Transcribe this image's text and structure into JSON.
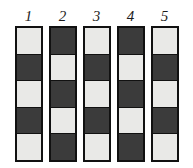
{
  "figure": {
    "title": "",
    "background_color": "#ffffff",
    "border_color": "#111111",
    "light_color": "#e9e9e7",
    "dark_color": "#3b3b3b",
    "rows": 5,
    "columns_count": 5,
    "columns": [
      {
        "label": "1",
        "cells": [
          "light",
          "dark",
          "light",
          "dark",
          "light"
        ]
      },
      {
        "label": "2",
        "cells": [
          "dark",
          "light",
          "dark",
          "light",
          "dark"
        ]
      },
      {
        "label": "3",
        "cells": [
          "light",
          "dark",
          "light",
          "dark",
          "light"
        ]
      },
      {
        "label": "4",
        "cells": [
          "dark",
          "light",
          "dark",
          "light",
          "dark"
        ]
      },
      {
        "label": "5",
        "cells": [
          "light",
          "dark",
          "light",
          "dark",
          "light"
        ]
      }
    ]
  }
}
